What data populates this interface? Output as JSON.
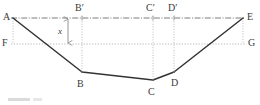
{
  "figure": {
    "type": "geometry-diagram",
    "colors": {
      "stroke": "#333333",
      "guide": "#9a9a9a",
      "chain": "#6e6e6e",
      "background": "#ffffff",
      "label": "#3a3a3a"
    },
    "canvas": {
      "width": 260,
      "height": 105
    }
  },
  "labels": {
    "A": "A",
    "B": "B",
    "C": "C",
    "D": "D",
    "E": "E",
    "F": "F",
    "G": "G",
    "B_prime": "B′",
    "C_prime": "C′",
    "D_prime": "D′",
    "x": "x"
  },
  "geometry": {
    "polyline_points": "13,18 82,72 153,80 174,72 243,18",
    "chain_line": {
      "x1": 13,
      "y1": 18,
      "x2": 243,
      "y2": 18
    },
    "dotted_line_FG": {
      "x1": 13,
      "y1": 44,
      "x2": 243,
      "y2": 44
    },
    "verticals": [
      {
        "name": "A-F",
        "x": 13,
        "y1": 18,
        "y2": 44
      },
      {
        "name": "x-dim",
        "x": 68,
        "y1": 18,
        "y2": 44
      },
      {
        "name": "B-B-prime",
        "x": 82,
        "y1": 18,
        "y2": 72
      },
      {
        "name": "C-C-prime",
        "x": 153,
        "y1": 18,
        "y2": 80
      },
      {
        "name": "D-D-prime",
        "x": 174,
        "y1": 18,
        "y2": 72
      },
      {
        "name": "E-G",
        "x": 243,
        "y1": 18,
        "y2": 44
      }
    ],
    "dimension_arrow": {
      "x": 68,
      "y_top": 18,
      "y_bottom": 44
    },
    "tick_marks_on_chain": [
      13,
      82,
      153,
      174,
      243
    ]
  },
  "label_positions": {
    "A": {
      "left": 3,
      "top": 12
    },
    "E": {
      "left": 247,
      "top": 12
    },
    "F": {
      "left": 2,
      "top": 38
    },
    "G": {
      "left": 248,
      "top": 38
    },
    "B": {
      "left": 77,
      "top": 79
    },
    "C": {
      "left": 148,
      "top": 87
    },
    "D": {
      "left": 171,
      "top": 78
    },
    "B_prime": {
      "left": 75,
      "top": 3
    },
    "C_prime": {
      "left": 146,
      "top": 3
    },
    "D_prime": {
      "left": 168,
      "top": 3
    },
    "x": {
      "left": 58,
      "top": 27
    }
  }
}
